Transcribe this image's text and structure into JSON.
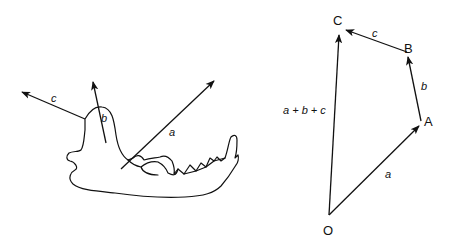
{
  "figure": {
    "left_panel": {
      "subject": "mandible (jaw bone) with muscle force vectors",
      "vectors": [
        {
          "name": "a",
          "label": "a"
        },
        {
          "name": "b",
          "label": "b"
        },
        {
          "name": "c",
          "label": "c"
        }
      ]
    },
    "right_panel": {
      "subject": "vector addition polygon",
      "points": {
        "O": "O",
        "A": "A",
        "B": "B",
        "C": "C"
      },
      "vectors": [
        {
          "from": "O",
          "to": "A",
          "label": "a"
        },
        {
          "from": "A",
          "to": "B",
          "label": "b"
        },
        {
          "from": "B",
          "to": "C",
          "label": "c"
        },
        {
          "from": "O",
          "to": "C",
          "label": "a + b + c"
        }
      ]
    },
    "colors": {
      "stroke": "#111111",
      "background": "#ffffff"
    }
  }
}
